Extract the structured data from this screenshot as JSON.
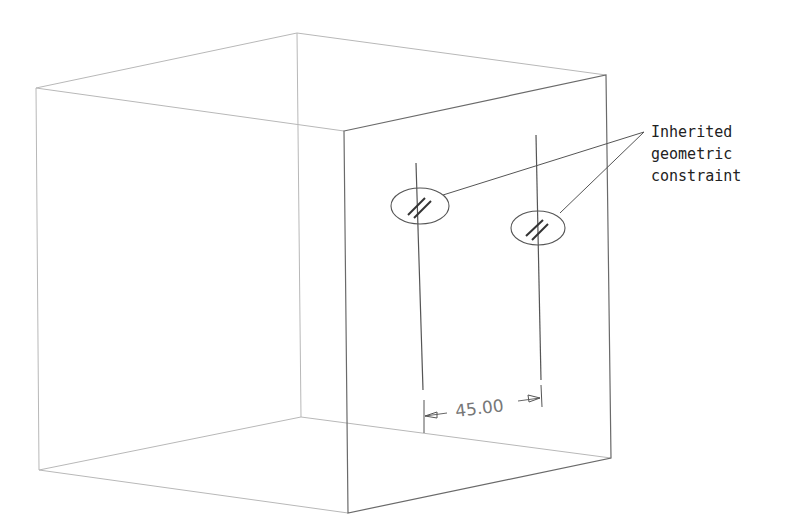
{
  "annotation": {
    "lines": [
      "Inherited",
      "geometric",
      "constraint"
    ]
  },
  "dimension": {
    "value": "45.00"
  },
  "constraint_symbol": "//",
  "colors": {
    "hidden_edge": "#b8b8b8",
    "front_edge": "#6a6a6a",
    "text": "#222222",
    "dimension_text": "#777777"
  }
}
